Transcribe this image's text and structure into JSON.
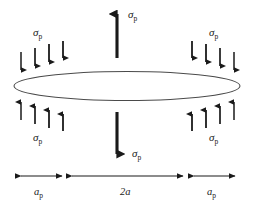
{
  "figure": {
    "background_color": "#ffffff",
    "ink_color": "#1a1a1a",
    "ellipse_stroke": "#4a4a4a"
  },
  "labels": {
    "sigma": "σ",
    "sigma_sub": "p",
    "dim_center": "2a",
    "dim_side": "a",
    "dim_side_sub": "p"
  },
  "annotations": {
    "top_resultant": {
      "symbol": "σ",
      "subscript": "p",
      "direction": "up"
    },
    "bottom_resultant": {
      "symbol": "σ",
      "subscript": "p",
      "direction": "down"
    },
    "upper_left_field": {
      "symbol": "σ",
      "subscript": "p",
      "direction": "down",
      "arrow_count": 4
    },
    "upper_right_field": {
      "symbol": "σ",
      "subscript": "p",
      "direction": "down",
      "arrow_count": 4
    },
    "lower_left_field": {
      "symbol": "σ",
      "subscript": "p",
      "direction": "up",
      "arrow_count": 4
    },
    "lower_right_field": {
      "symbol": "σ",
      "subscript": "p",
      "direction": "up",
      "arrow_count": 4
    }
  },
  "dimensions": [
    {
      "name": "left-annulus",
      "label": "a",
      "subscript": "p"
    },
    {
      "name": "crack-diameter",
      "label": "2a",
      "subscript": ""
    },
    {
      "name": "right-annulus",
      "label": "a",
      "subscript": "p"
    }
  ]
}
